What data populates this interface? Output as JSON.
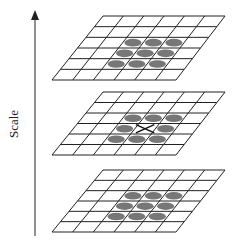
{
  "axis": {
    "label": "Scale",
    "direction": "up",
    "x": 35,
    "y_top": 10,
    "y_bottom": 236,
    "color": "#222222"
  },
  "grid": {
    "cols": 6,
    "rows": 6,
    "line_color": "#222222",
    "blob_color": "#777777",
    "marker_color": "#111111"
  },
  "levels": [
    {
      "name": "upper-scale",
      "top_y": 16,
      "top_left_x": 103,
      "top_right_x": 225,
      "bottom_y": 80,
      "bottom_left_x": 52,
      "bottom_right_x": 176,
      "neighbors": [
        [
          2,
          2
        ],
        [
          2,
          3
        ],
        [
          2,
          4
        ],
        [
          3,
          2
        ],
        [
          3,
          3
        ],
        [
          3,
          4
        ],
        [
          4,
          2
        ],
        [
          4,
          3
        ],
        [
          4,
          4
        ]
      ],
      "sample_marker": false
    },
    {
      "name": "current-scale",
      "top_y": 92,
      "top_left_x": 103,
      "top_right_x": 225,
      "bottom_y": 155,
      "bottom_left_x": 52,
      "bottom_right_x": 176,
      "neighbors": [
        [
          2,
          2
        ],
        [
          2,
          3
        ],
        [
          2,
          4
        ],
        [
          3,
          2
        ],
        [
          3,
          4
        ],
        [
          4,
          2
        ],
        [
          4,
          3
        ],
        [
          4,
          4
        ]
      ],
      "sample_marker": true,
      "sample_cell": [
        3,
        3
      ]
    },
    {
      "name": "lower-scale",
      "top_y": 170,
      "top_left_x": 103,
      "top_right_x": 225,
      "bottom_y": 232,
      "bottom_left_x": 52,
      "bottom_right_x": 176,
      "neighbors": [
        [
          2,
          2
        ],
        [
          2,
          3
        ],
        [
          2,
          4
        ],
        [
          3,
          2
        ],
        [
          3,
          3
        ],
        [
          3,
          4
        ],
        [
          4,
          2
        ],
        [
          4,
          3
        ],
        [
          4,
          4
        ]
      ],
      "sample_marker": false
    }
  ]
}
